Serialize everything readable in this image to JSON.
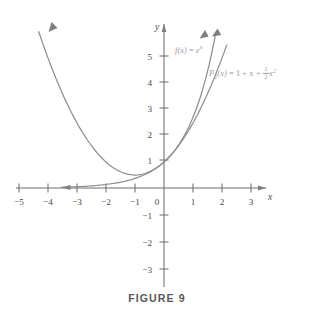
{
  "figure": {
    "caption": "FIGURE 9",
    "background_color": "#ffffff",
    "curve_color": "#8f8f90",
    "axis_color": "#6f6f70",
    "label_color": "#9a9a9c"
  },
  "axes": {
    "x_name": "x",
    "y_name": "y",
    "origin_label": "0",
    "x_ticks": [
      {
        "value": -5,
        "label": "−5"
      },
      {
        "value": -4,
        "label": "−4"
      },
      {
        "value": -3,
        "label": "−3"
      },
      {
        "value": -2,
        "label": "−2"
      },
      {
        "value": -1,
        "label": "−1"
      },
      {
        "value": 1,
        "label": "1"
      },
      {
        "value": 2,
        "label": "2"
      },
      {
        "value": 3,
        "label": "3"
      }
    ],
    "y_ticks": [
      {
        "value": 5,
        "label": "5"
      },
      {
        "value": 4,
        "label": "4"
      },
      {
        "value": 3,
        "label": "3"
      },
      {
        "value": 2,
        "label": "2"
      },
      {
        "value": 1,
        "label": "1"
      },
      {
        "value": -1,
        "label": "−1"
      },
      {
        "value": -2,
        "label": "−2"
      },
      {
        "value": -3,
        "label": "−3"
      }
    ]
  },
  "labels": {
    "exponential": {
      "lhs": "f(x)",
      "eq": " = ",
      "base": "e",
      "exponent": "x"
    },
    "taylor": {
      "lhs": "P",
      "subscript": "2",
      "arg": "(x)",
      "eq": " = 1 + x + ",
      "frac_num": "1",
      "frac_den": "2",
      "tail_base": "x",
      "tail_exp": "2"
    }
  },
  "chart_data": {
    "type": "line",
    "title": "FIGURE 9",
    "xlabel": "x",
    "ylabel": "y",
    "grid": false,
    "legend": "inline-annotations",
    "xlim": [
      -5.6,
      3.6
    ],
    "ylim": [
      -3.4,
      5.6
    ],
    "series": [
      {
        "name": "f(x) = e^x",
        "expression": "e^x",
        "x": [
          -3.6,
          -3.2,
          -2.8,
          -2.4,
          -2.0,
          -1.6,
          -1.2,
          -0.8,
          -0.4,
          0.0,
          0.4,
          0.8,
          1.2,
          1.6,
          1.75
        ],
        "y": [
          0.027,
          0.041,
          0.061,
          0.091,
          0.135,
          0.202,
          0.301,
          0.449,
          0.67,
          1.0,
          1.492,
          2.226,
          3.32,
          4.953,
          5.75
        ],
        "arrow_ends": [
          "left",
          "top-right"
        ]
      },
      {
        "name": "P_2(x) = 1 + x + (1/2)x^2",
        "expression": "1 + x + 0.5*x^2",
        "x": [
          -4.3,
          -4.0,
          -3.5,
          -3.0,
          -2.5,
          -2.0,
          -1.5,
          -1.0,
          -0.5,
          0.0,
          0.5,
          1.0,
          1.5,
          2.0,
          2.15
        ],
        "y": [
          6.545,
          6.0,
          4.625,
          3.5,
          2.625,
          2.0,
          1.625,
          1.5,
          1.625,
          1.0,
          1.625,
          2.5,
          3.625,
          5.0,
          5.46
        ],
        "vertex": [
          -1.0,
          0.5
        ],
        "arrow_ends": [
          "top-left",
          "top-right"
        ]
      }
    ],
    "annotations": [
      {
        "text": "f(x) = e^x",
        "x_px": 175,
        "y_px": 44
      },
      {
        "text": "P_2(x) = 1 + x + 1/2 x^2",
        "x_px": 209,
        "y_px": 66
      }
    ]
  }
}
